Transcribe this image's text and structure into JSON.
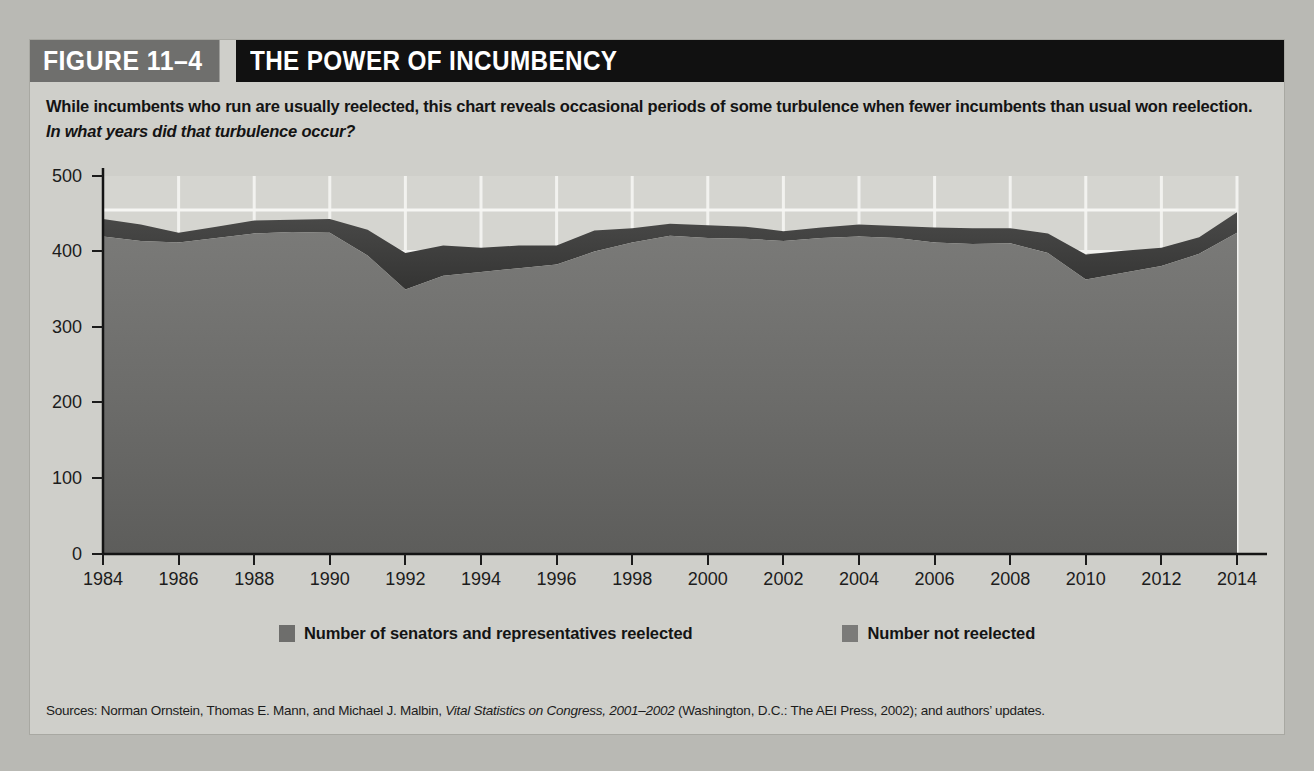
{
  "figure": {
    "number": "FIGURE 11–4",
    "title": "THE POWER OF INCUMBENCY",
    "subtitle_main": "While incumbents who run are usually reelected, this chart reveals occasional periods of some turbulence when fewer incumbents than usual won reelection. ",
    "subtitle_question": "In what years did that turbulence occur?",
    "source_prefix": "Sources: Norman Ornstein, Thomas E. Mann, and Michael J. Malbin, ",
    "source_italic": "Vital Statistics on Congress, 2001–2002",
    "source_suffix": " (Washington, D.C.: The AEI Press, 2002); and authors’ updates."
  },
  "colors": {
    "panel_background": "#cfcfca",
    "header_number_bg": "#6f6f6d",
    "header_title_bg": "#111111",
    "plot_background": "#d5d5d0",
    "reelected_fill": "#6e6e6c",
    "not_reelected_fill": "#3f3f3f",
    "gridline": "#f2f2ef",
    "axis": "#141414"
  },
  "chart_data": {
    "type": "area",
    "title": "THE POWER OF INCUMBENCY",
    "stacked": true,
    "xlabel": "",
    "ylabel": "",
    "ylim": [
      0,
      500
    ],
    "xlim": [
      1984,
      2014
    ],
    "grid": true,
    "legend_position": "bottom",
    "yticks": [
      0,
      100,
      200,
      300,
      400,
      500
    ],
    "xticks": [
      1984,
      1986,
      1988,
      1990,
      1992,
      1994,
      1996,
      1998,
      2000,
      2002,
      2004,
      2006,
      2008,
      2010,
      2012,
      2014
    ],
    "x": [
      1984,
      1985,
      1986,
      1987,
      1988,
      1989,
      1990,
      1991,
      1992,
      1993,
      1994,
      1995,
      1996,
      1997,
      1998,
      1999,
      2000,
      2001,
      2002,
      2003,
      2004,
      2005,
      2006,
      2007,
      2008,
      2009,
      2010,
      2011,
      2012,
      2013,
      2014
    ],
    "series": [
      {
        "name": "Number of senators and representatives reelected",
        "color": "#6e6e6c",
        "values": [
          420,
          414,
          412,
          418,
          424,
          426,
          425,
          395,
          350,
          368,
          373,
          378,
          383,
          400,
          412,
          421,
          418,
          417,
          414,
          418,
          420,
          418,
          412,
          410,
          411,
          398,
          363,
          372,
          381,
          397,
          425
        ]
      },
      {
        "name": "Number not reelected",
        "color": "#3f3f3f",
        "values": [
          23,
          22,
          13,
          15,
          17,
          16,
          18,
          34,
          48,
          40,
          32,
          30,
          25,
          28,
          19,
          16,
          17,
          16,
          13,
          14,
          16,
          16,
          20,
          21,
          20,
          26,
          33,
          29,
          24,
          22,
          27
        ]
      }
    ],
    "series_totals": [
      443,
      436,
      425,
      433,
      441,
      442,
      443,
      429,
      398,
      408,
      405,
      408,
      408,
      428,
      431,
      437,
      435,
      433,
      427,
      432,
      436,
      434,
      432,
      431,
      431,
      424,
      396,
      401,
      405,
      419,
      452
    ]
  },
  "legend": [
    {
      "label": "Number of senators and representatives reelected",
      "swatch": "#6e6e6c"
    },
    {
      "label": "Number not reelected",
      "swatch": "#7b7b79"
    }
  ]
}
